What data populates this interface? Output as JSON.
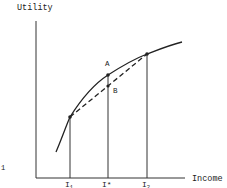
{
  "diagram": {
    "type": "utility-of-income curve",
    "y_axis_label": "Utility",
    "x_axis_label": "Income",
    "x_ticks": [
      {
        "label": "I",
        "sub": "1",
        "x": 70
      },
      {
        "label": "I*",
        "sub": "",
        "x": 108
      },
      {
        "label": "I",
        "sub": "2",
        "x": 147
      }
    ],
    "points": [
      {
        "name": "A",
        "x": 108,
        "y": 75
      },
      {
        "name": "B",
        "x": 108,
        "y": 86
      }
    ],
    "stray_mark": "1",
    "colors": {
      "ink": "#222222",
      "background": "#ffffff"
    }
  }
}
